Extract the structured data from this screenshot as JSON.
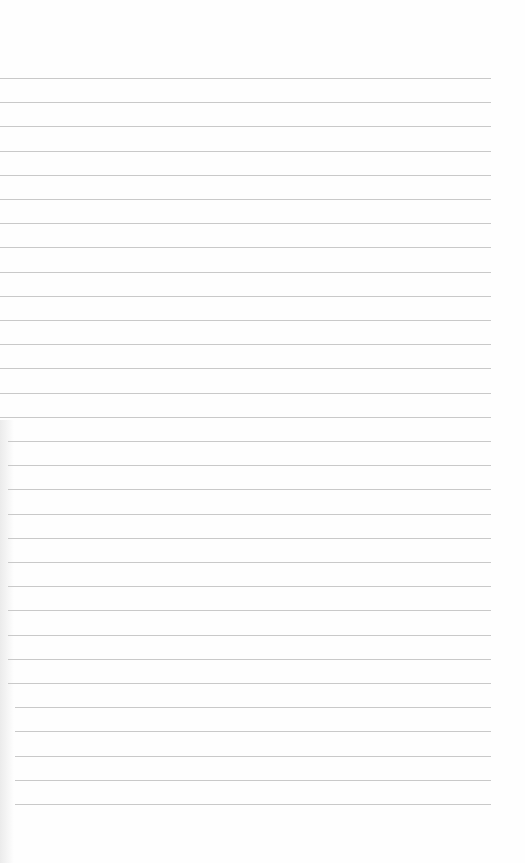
{
  "paper": {
    "background": "#fefefe",
    "line_color": "#c9c9c9",
    "line_count": 31,
    "first_line_y": 78,
    "line_spacing": 24.2,
    "line_left": 0,
    "line_right": 491
  }
}
